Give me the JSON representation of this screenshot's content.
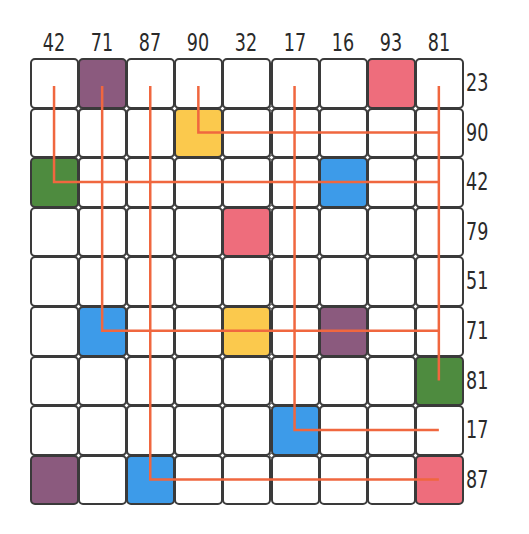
{
  "puzzle": {
    "columns": [
      "42",
      "71",
      "87",
      "90",
      "32",
      "17",
      "16",
      "93",
      "81"
    ],
    "rows": [
      "23",
      "90",
      "42",
      "79",
      "51",
      "71",
      "81",
      "17",
      "87"
    ],
    "colors": {
      "purple": "#8B5A7E",
      "pink": "#EE6D7C",
      "yellow": "#FBC94D",
      "green": "#4E8B3F",
      "blue": "#3D9BE9",
      "line": "#F0673F"
    },
    "filled_cells": [
      {
        "row": 0,
        "col": 1,
        "color": "purple"
      },
      {
        "row": 0,
        "col": 7,
        "color": "pink"
      },
      {
        "row": 1,
        "col": 3,
        "color": "yellow"
      },
      {
        "row": 2,
        "col": 0,
        "color": "green"
      },
      {
        "row": 2,
        "col": 6,
        "color": "blue"
      },
      {
        "row": 3,
        "col": 4,
        "color": "pink"
      },
      {
        "row": 5,
        "col": 1,
        "color": "blue"
      },
      {
        "row": 5,
        "col": 4,
        "color": "yellow"
      },
      {
        "row": 5,
        "col": 6,
        "color": "purple"
      },
      {
        "row": 6,
        "col": 8,
        "color": "green"
      },
      {
        "row": 7,
        "col": 5,
        "color": "blue"
      },
      {
        "row": 8,
        "col": 0,
        "color": "purple"
      },
      {
        "row": 8,
        "col": 2,
        "color": "blue"
      },
      {
        "row": 8,
        "col": 8,
        "color": "pink"
      }
    ],
    "connections": [
      {
        "col": 0,
        "row": 2,
        "value": "42"
      },
      {
        "col": 1,
        "row": 5,
        "value": "71"
      },
      {
        "col": 2,
        "row": 8,
        "value": "87"
      },
      {
        "col": 3,
        "row": 1,
        "value": "90"
      },
      {
        "col": 5,
        "row": 7,
        "value": "17"
      },
      {
        "col": 8,
        "row": 6,
        "value": "81"
      }
    ]
  }
}
